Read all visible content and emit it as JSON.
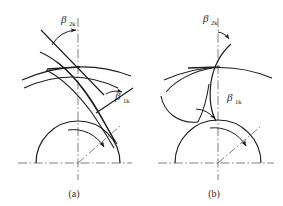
{
  "figure": {
    "background_color": "#ffffff",
    "line_color": "#1d1d1d",
    "axis_color": "#6f6f6f",
    "panels": [
      {
        "id": "a",
        "caption": "(a)",
        "caption_x": 74,
        "caption_y": 197,
        "center": {
          "x": 78,
          "y": 163
        },
        "circle_radius": 42,
        "blade_intersection": {
          "x": 78,
          "y": 62
        },
        "labels": [
          {
            "name": "outlet-angle-label",
            "symbol": "β",
            "subscript": "2k",
            "x": 61,
            "y": 23,
            "description": "beta 2k outlet blade angle"
          },
          {
            "name": "inlet-angle-label",
            "symbol": "β",
            "subscript": "1k",
            "x": 115,
            "y": 100,
            "description": "beta 1k inlet blade angle"
          }
        ]
      },
      {
        "id": "b",
        "caption": "(b)",
        "caption_x": 214,
        "caption_y": 197,
        "center": {
          "x": 218,
          "y": 163
        },
        "circle_radius": 43,
        "blade_intersection": {
          "x": 218,
          "y": 62
        },
        "labels": [
          {
            "name": "outlet-angle-label",
            "symbol": "β",
            "subscript": "2k",
            "x": 203,
            "y": 22,
            "description": "beta 2k outlet blade angle"
          },
          {
            "name": "inlet-angle-label",
            "symbol": "β",
            "subscript": "1k",
            "x": 227,
            "y": 101,
            "description": "beta 1k inlet blade angle"
          }
        ]
      }
    ]
  }
}
